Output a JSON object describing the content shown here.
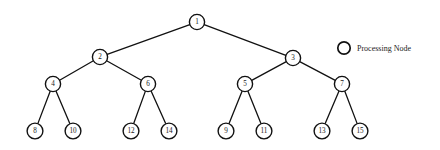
{
  "figure": {
    "background_color": "#ffffff",
    "stroke_color": "#111111",
    "width": 440,
    "height": 150
  },
  "tree": {
    "type": "binary-tree",
    "levels": 4,
    "node_radius": 7.5,
    "leaf_node_radius": 7.8,
    "nodes": [
      {
        "id": "n1",
        "label": "1",
        "x": 197,
        "y": 22,
        "level": 0,
        "r": 7.6
      },
      {
        "id": "n2",
        "label": "2",
        "x": 100,
        "y": 57,
        "level": 1,
        "r": 7.6
      },
      {
        "id": "n3",
        "label": "3",
        "x": 293,
        "y": 58,
        "level": 1,
        "r": 7.6
      },
      {
        "id": "n4",
        "label": "4",
        "x": 53,
        "y": 84,
        "level": 2,
        "r": 7.6
      },
      {
        "id": "n6",
        "label": "6",
        "x": 148,
        "y": 84,
        "level": 2,
        "r": 7.6
      },
      {
        "id": "n5",
        "label": "5",
        "x": 245,
        "y": 84,
        "level": 2,
        "r": 7.6
      },
      {
        "id": "n7",
        "label": "7",
        "x": 342,
        "y": 84,
        "level": 2,
        "r": 7.6
      },
      {
        "id": "n8",
        "label": "8",
        "x": 35,
        "y": 131,
        "level": 3,
        "r": 7.9
      },
      {
        "id": "n10",
        "label": "10",
        "x": 73,
        "y": 131,
        "level": 3,
        "r": 7.9
      },
      {
        "id": "n12",
        "label": "12",
        "x": 131,
        "y": 131,
        "level": 3,
        "r": 7.9
      },
      {
        "id": "n14",
        "label": "14",
        "x": 169,
        "y": 131,
        "level": 3,
        "r": 7.9
      },
      {
        "id": "n9",
        "label": "9",
        "x": 226,
        "y": 131,
        "level": 3,
        "r": 7.9
      },
      {
        "id": "n11",
        "label": "11",
        "x": 264,
        "y": 131,
        "level": 3,
        "r": 7.9
      },
      {
        "id": "n13",
        "label": "13",
        "x": 322,
        "y": 131,
        "level": 3,
        "r": 7.9
      },
      {
        "id": "n15",
        "label": "15",
        "x": 360,
        "y": 131,
        "level": 3,
        "r": 7.9
      }
    ],
    "edges": [
      {
        "from": "n1",
        "to": "n2"
      },
      {
        "from": "n1",
        "to": "n3"
      },
      {
        "from": "n2",
        "to": "n4"
      },
      {
        "from": "n2",
        "to": "n6"
      },
      {
        "from": "n3",
        "to": "n5"
      },
      {
        "from": "n3",
        "to": "n7"
      },
      {
        "from": "n4",
        "to": "n8"
      },
      {
        "from": "n4",
        "to": "n10"
      },
      {
        "from": "n6",
        "to": "n12"
      },
      {
        "from": "n6",
        "to": "n14"
      },
      {
        "from": "n5",
        "to": "n9"
      },
      {
        "from": "n5",
        "to": "n11"
      },
      {
        "from": "n7",
        "to": "n13"
      },
      {
        "from": "n7",
        "to": "n15"
      }
    ]
  },
  "legend": {
    "symbol": "circle-outline",
    "symbol_x": 344,
    "symbol_y": 48,
    "symbol_r": 6.2,
    "text": "Processing Node",
    "text_x": 357,
    "text_y": 48
  }
}
